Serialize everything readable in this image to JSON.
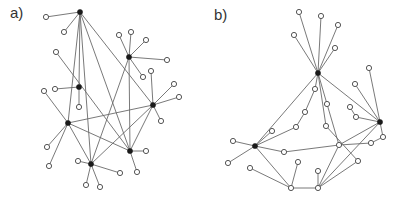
{
  "panels": [
    {
      "label": "a)",
      "label_pos": [
        10,
        4
      ],
      "hubs": [
        [
          80,
          12
        ],
        [
          129,
          57
        ],
        [
          79,
          87
        ],
        [
          153,
          105
        ],
        [
          68,
          123
        ],
        [
          130,
          151
        ],
        [
          91,
          164
        ]
      ],
      "leaves": [
        [
          46,
          17
        ],
        [
          64,
          32
        ],
        [
          119,
          35
        ],
        [
          131,
          32
        ],
        [
          146,
          40
        ],
        [
          167,
          60
        ],
        [
          143,
          77
        ],
        [
          55,
          89
        ],
        [
          79,
          107
        ],
        [
          151,
          71
        ],
        [
          174,
          84
        ],
        [
          179,
          97
        ],
        [
          161,
          121
        ],
        [
          44,
          91
        ],
        [
          56,
          52
        ],
        [
          47,
          147
        ],
        [
          49,
          166
        ],
        [
          146,
          151
        ],
        [
          137,
          172
        ],
        [
          78,
          161
        ],
        [
          120,
          173
        ],
        [
          86,
          185
        ],
        [
          100,
          187
        ]
      ],
      "edges": [
        [
          [
            80,
            12
          ],
          [
            46,
            17
          ]
        ],
        [
          [
            80,
            12
          ],
          [
            64,
            32
          ]
        ],
        [
          [
            80,
            12
          ],
          [
            79,
            87
          ]
        ],
        [
          [
            80,
            12
          ],
          [
            68,
            123
          ]
        ],
        [
          [
            80,
            12
          ],
          [
            91,
            164
          ]
        ],
        [
          [
            80,
            12
          ],
          [
            130,
            151
          ]
        ],
        [
          [
            80,
            12
          ],
          [
            153,
            105
          ]
        ],
        [
          [
            129,
            57
          ],
          [
            119,
            35
          ]
        ],
        [
          [
            129,
            57
          ],
          [
            131,
            32
          ]
        ],
        [
          [
            129,
            57
          ],
          [
            146,
            40
          ]
        ],
        [
          [
            129,
            57
          ],
          [
            167,
            60
          ]
        ],
        [
          [
            129,
            57
          ],
          [
            143,
            77
          ]
        ],
        [
          [
            129,
            57
          ],
          [
            91,
            164
          ]
        ],
        [
          [
            129,
            57
          ],
          [
            130,
            151
          ]
        ],
        [
          [
            79,
            87
          ],
          [
            55,
            89
          ]
        ],
        [
          [
            79,
            87
          ],
          [
            79,
            107
          ]
        ],
        [
          [
            56,
            52
          ],
          [
            130,
            151
          ]
        ],
        [
          [
            153,
            105
          ],
          [
            151,
            71
          ]
        ],
        [
          [
            153,
            105
          ],
          [
            174,
            84
          ]
        ],
        [
          [
            153,
            105
          ],
          [
            179,
            97
          ]
        ],
        [
          [
            153,
            105
          ],
          [
            161,
            121
          ]
        ],
        [
          [
            153,
            105
          ],
          [
            68,
            123
          ]
        ],
        [
          [
            153,
            105
          ],
          [
            91,
            164
          ]
        ],
        [
          [
            153,
            105
          ],
          [
            130,
            151
          ]
        ],
        [
          [
            68,
            123
          ],
          [
            44,
            91
          ]
        ],
        [
          [
            68,
            123
          ],
          [
            47,
            147
          ]
        ],
        [
          [
            68,
            123
          ],
          [
            49,
            166
          ]
        ],
        [
          [
            68,
            123
          ],
          [
            130,
            151
          ]
        ],
        [
          [
            68,
            123
          ],
          [
            91,
            164
          ]
        ],
        [
          [
            130,
            151
          ],
          [
            146,
            151
          ]
        ],
        [
          [
            130,
            151
          ],
          [
            137,
            172
          ]
        ],
        [
          [
            91,
            164
          ],
          [
            78,
            161
          ]
        ],
        [
          [
            91,
            164
          ],
          [
            120,
            173
          ]
        ],
        [
          [
            91,
            164
          ],
          [
            86,
            185
          ]
        ],
        [
          [
            91,
            164
          ],
          [
            100,
            187
          ]
        ]
      ]
    },
    {
      "label": "b)",
      "label_pos": [
        214,
        6
      ],
      "hubs": [
        [
          318,
          73
        ],
        [
          380,
          122
        ],
        [
          255,
          146
        ]
      ],
      "leaves": [
        [
          299,
          12
        ],
        [
          321,
          16
        ],
        [
          338,
          25
        ],
        [
          294,
          35
        ],
        [
          335,
          48
        ],
        [
          315,
          89
        ],
        [
          305,
          112
        ],
        [
          296,
          127
        ],
        [
          272,
          131
        ],
        [
          327,
          104
        ],
        [
          326,
          126
        ],
        [
          339,
          145
        ],
        [
          369,
          68
        ],
        [
          355,
          84
        ],
        [
          350,
          107
        ],
        [
          356,
          117
        ],
        [
          383,
          137
        ],
        [
          371,
          143
        ],
        [
          358,
          161
        ],
        [
          233,
          141
        ],
        [
          228,
          163
        ],
        [
          250,
          168
        ],
        [
          284,
          152
        ],
        [
          298,
          162
        ],
        [
          318,
          171
        ],
        [
          291,
          188
        ],
        [
          318,
          188
        ]
      ],
      "edges": [
        [
          [
            318,
            73
          ],
          [
            299,
            12
          ]
        ],
        [
          [
            318,
            73
          ],
          [
            321,
            16
          ]
        ],
        [
          [
            318,
            73
          ],
          [
            338,
            25
          ]
        ],
        [
          [
            318,
            73
          ],
          [
            294,
            35
          ]
        ],
        [
          [
            318,
            73
          ],
          [
            335,
            48
          ]
        ],
        [
          [
            318,
            73
          ],
          [
            255,
            146
          ]
        ],
        [
          [
            318,
            73
          ],
          [
            380,
            122
          ]
        ],
        [
          [
            318,
            73
          ],
          [
            315,
            89
          ]
        ],
        [
          [
            315,
            89
          ],
          [
            305,
            112
          ]
        ],
        [
          [
            305,
            112
          ],
          [
            296,
            127
          ]
        ],
        [
          [
            296,
            127
          ],
          [
            255,
            146
          ]
        ],
        [
          [
            318,
            73
          ],
          [
            327,
            104
          ]
        ],
        [
          [
            327,
            104
          ],
          [
            339,
            145
          ]
        ],
        [
          [
            318,
            73
          ],
          [
            326,
            126
          ]
        ],
        [
          [
            326,
            126
          ],
          [
            358,
            161
          ]
        ],
        [
          [
            380,
            122
          ],
          [
            369,
            68
          ]
        ],
        [
          [
            380,
            122
          ],
          [
            355,
            84
          ]
        ],
        [
          [
            350,
            107
          ],
          [
            356,
            117
          ]
        ],
        [
          [
            356,
            117
          ],
          [
            380,
            122
          ]
        ],
        [
          [
            380,
            122
          ],
          [
            383,
            137
          ]
        ],
        [
          [
            383,
            137
          ],
          [
            371,
            143
          ]
        ],
        [
          [
            371,
            143
          ],
          [
            339,
            145
          ]
        ],
        [
          [
            380,
            122
          ],
          [
            339,
            145
          ]
        ],
        [
          [
            380,
            122
          ],
          [
            318,
            188
          ]
        ],
        [
          [
            255,
            146
          ],
          [
            233,
            141
          ]
        ],
        [
          [
            255,
            146
          ],
          [
            228,
            163
          ]
        ],
        [
          [
            255,
            146
          ],
          [
            272,
            131
          ]
        ],
        [
          [
            255,
            146
          ],
          [
            284,
            152
          ]
        ],
        [
          [
            284,
            152
          ],
          [
            339,
            145
          ]
        ],
        [
          [
            255,
            146
          ],
          [
            291,
            188
          ]
        ],
        [
          [
            291,
            188
          ],
          [
            250,
            168
          ]
        ],
        [
          [
            291,
            188
          ],
          [
            298,
            162
          ]
        ],
        [
          [
            291,
            188
          ],
          [
            318,
            188
          ]
        ],
        [
          [
            318,
            188
          ],
          [
            318,
            171
          ]
        ],
        [
          [
            318,
            188
          ],
          [
            358,
            161
          ]
        ],
        [
          [
            339,
            145
          ],
          [
            318,
            188
          ]
        ]
      ]
    }
  ],
  "style": {
    "edge_color": "#6a6a6a",
    "hub_color": "#1a1a1a",
    "leaf_stroke": "#555555",
    "hub_radius": 2.6,
    "leaf_radius": 2.6
  }
}
